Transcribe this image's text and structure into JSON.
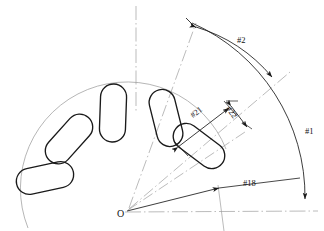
{
  "figure": {
    "type": "engineering-diagram",
    "background_color": "#ffffff",
    "line_color": "#1a1a1a",
    "construction_line_color": "#9a9a9a",
    "origin_label": "O"
  },
  "labels": {
    "angle_total": "#1",
    "angle_segment": "#2",
    "angle_start": "#18",
    "length": "#21",
    "width": "#22",
    "origin": "O"
  },
  "dimensions": [
    {
      "id": "#1",
      "kind": "angle",
      "name": "total-sweep-angle",
      "label": "#1"
    },
    {
      "id": "#2",
      "kind": "angle",
      "name": "segment-angle",
      "label": "#2"
    },
    {
      "id": "#18",
      "kind": "angle",
      "name": "start-angle",
      "label": "#18"
    },
    {
      "id": "#21",
      "kind": "length",
      "name": "capsule-length",
      "label": "#21"
    },
    {
      "id": "#22",
      "kind": "length",
      "name": "capsule-width",
      "label": "#22"
    }
  ],
  "capsules": [
    {
      "index": 1,
      "cx": 45,
      "cy": 178,
      "rotation": -12,
      "length": 58,
      "width": 26
    },
    {
      "index": 2,
      "cx": 69,
      "cy": 139,
      "rotation": -48,
      "length": 58,
      "width": 26
    },
    {
      "index": 3,
      "cx": 113,
      "cy": 113,
      "rotation": -88,
      "length": 58,
      "width": 26
    },
    {
      "index": 4,
      "cx": 166,
      "cy": 118,
      "rotation": -104,
      "length": 58,
      "width": 26
    },
    {
      "index": 5,
      "cx": 199,
      "cy": 146,
      "rotation": -143,
      "length": 58,
      "width": 26
    }
  ],
  "geometry": {
    "origin": {
      "x": 125,
      "y": 212
    },
    "arc_radius_inner": 100,
    "arc_radius_outer": 185,
    "arc_radius_mid": 150,
    "horizontal_axis_end_x": 318,
    "vertical_axis_top_y": 6
  }
}
